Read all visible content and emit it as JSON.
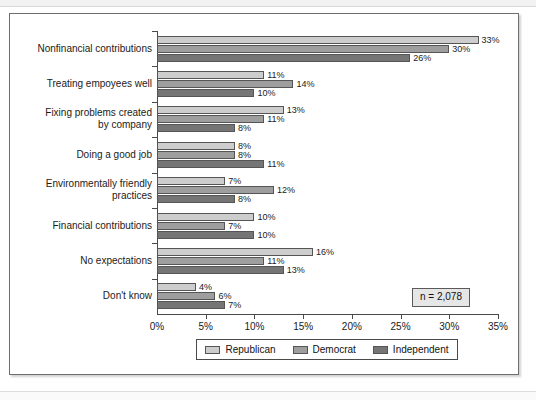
{
  "figure": {
    "sample_size_note": "n = 2,078"
  },
  "chart_data": {
    "type": "bar",
    "orientation": "horizontal",
    "title": "",
    "xlabel": "",
    "ylabel": "",
    "xlim": [
      0,
      35
    ],
    "xunit": "%",
    "grid": false,
    "legend_position": "bottom",
    "xticks": [
      "0%",
      "5%",
      "10%",
      "15%",
      "20%",
      "25%",
      "30%",
      "35%"
    ],
    "xtick_values": [
      0,
      5,
      10,
      15,
      20,
      25,
      30,
      35
    ],
    "categories": [
      "Nonfinancial contributions",
      "Treating empoyees well",
      "Fixing problems created by company",
      "Doing a good job",
      "Environmentally friendly practices",
      "Financial contributions",
      "No expectations",
      "Don't know"
    ],
    "category_lines": [
      [
        "Nonfinancial contributions"
      ],
      [
        "Treating empoyees well"
      ],
      [
        "Fixing problems created",
        "by company"
      ],
      [
        "Doing a good job"
      ],
      [
        "Environmentally friendly",
        "practices"
      ],
      [
        "Financial contributions"
      ],
      [
        "No expectations"
      ],
      [
        "Don't know"
      ]
    ],
    "series": [
      {
        "name": "Republican",
        "color": "#cdcdcd",
        "values": [
          33,
          11,
          13,
          8,
          7,
          10,
          16,
          4
        ],
        "labels": [
          "33%",
          "11%",
          "13%",
          "8%",
          "7%",
          "10%",
          "16%",
          "4%"
        ]
      },
      {
        "name": "Democrat",
        "color": "#9e9e9e",
        "values": [
          30,
          14,
          11,
          8,
          12,
          7,
          11,
          6
        ],
        "labels": [
          "30%",
          "14%",
          "11%",
          "8%",
          "12%",
          "7%",
          "11%",
          "6%"
        ]
      },
      {
        "name": "Independent",
        "color": "#757575",
        "values": [
          26,
          10,
          8,
          11,
          8,
          10,
          13,
          7
        ],
        "labels": [
          "26%",
          "10%",
          "8%",
          "11%",
          "8%",
          "10%",
          "13%",
          "7%"
        ]
      }
    ]
  }
}
